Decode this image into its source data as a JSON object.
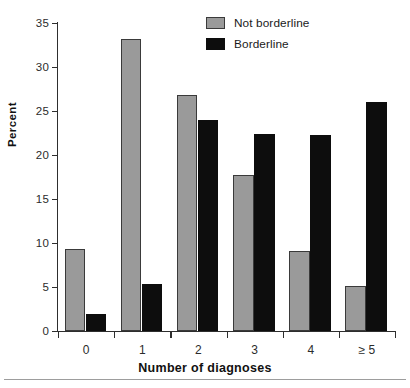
{
  "chart_data": {
    "type": "bar",
    "title": "",
    "xlabel": "Number of diagnoses",
    "ylabel": "Percent",
    "categories": [
      "0",
      "1",
      "2",
      "3",
      "4",
      "≥ 5"
    ],
    "series": [
      {
        "name": "Not borderline",
        "color": "#9a9a9a",
        "values": [
          9.3,
          33.2,
          26.8,
          17.7,
          9.1,
          5.1
        ]
      },
      {
        "name": "Borderline",
        "color": "#0d0d0d",
        "values": [
          1.9,
          5.3,
          24.0,
          22.4,
          22.3,
          26.0
        ]
      }
    ],
    "ylim": [
      0,
      35
    ],
    "yticks": [
      0,
      5,
      10,
      15,
      20,
      25,
      30,
      35
    ],
    "ytick_labels": [
      "0",
      "5",
      "10",
      "15",
      "20",
      "25",
      "30",
      "35"
    ],
    "grid": false,
    "legend_position": "top-center-right"
  },
  "legend": {
    "items": [
      {
        "label": "Not borderline",
        "swatch": "gray-swatch"
      },
      {
        "label": "Borderline",
        "swatch": "black-swatch"
      }
    ]
  }
}
